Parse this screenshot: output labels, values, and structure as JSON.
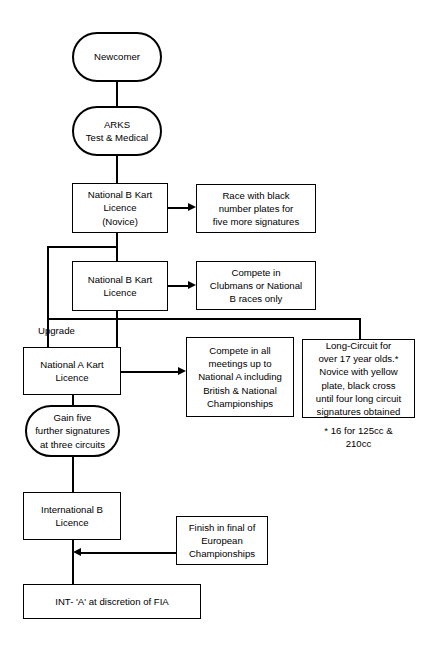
{
  "diagram": {
    "nodes": {
      "newcomer": "Newcomer",
      "arks": "ARKS\nTest & Medical",
      "nat_b_novice": "National B Kart\nLicence\n(Novice)",
      "race_black_plates": "Race with black\nnumber plates for\nfive more signatures",
      "nat_b": "National B Kart\nLicence",
      "compete_clubmans": "Compete in\nClubmans or National\nB races only",
      "nat_a": "National A Kart\nLicence",
      "compete_all": "Compete in all\nmeetings up to\nNational A including\nBritish & National\nChampionships",
      "long_circuit": "Long-Circuit for\nover 17 year olds.*\nNovice with yellow\nplate, black cross\nuntil four long circuit\nsignatures obtained",
      "gain_five": "Gain five\nfurther signatures\nat three circuits",
      "international_b": "International B\nLicence",
      "finish_european": "Finish in final of\nEuropean\nChampionships",
      "int_a": "INT- 'A' at discretion of FIA"
    },
    "labels": {
      "upgrade": "Upgrade",
      "footnote": "* 16 for 125cc &\n210cc"
    },
    "colors": {
      "stroke": "#000000",
      "background": "#ffffff"
    }
  }
}
